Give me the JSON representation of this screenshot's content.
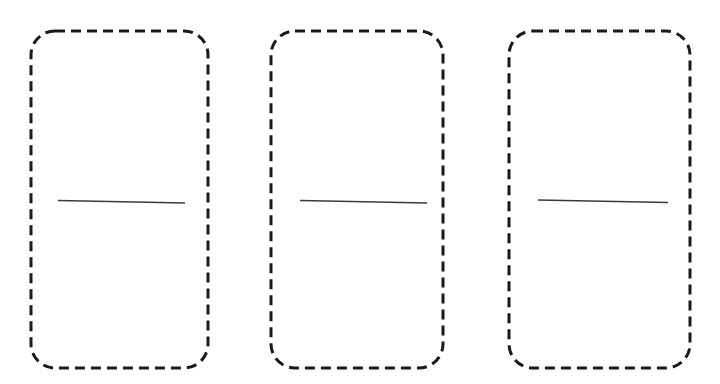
{
  "canvas": {
    "width": 720,
    "height": 384,
    "background_color": "#ffffff",
    "description": "Three blank domino tiles drawn as dashed rounded rectangles with a horizontal divider line"
  },
  "style": {
    "outline_color": "#1a1a1a",
    "outline_width": 3,
    "dash_length": 10,
    "dash_gap": 6,
    "corner_radius": 24,
    "divider_color": "#3a3a3a",
    "divider_width": 1.4,
    "fill_color": "#ffffff"
  },
  "tiles": [
    {
      "name": "tile-1",
      "label": "",
      "x": 31,
      "y": 31,
      "width": 177,
      "height": 337,
      "divider": {
        "x1": 58,
        "y1": 200.5,
        "x2": 185,
        "y2": 203.0
      },
      "top_pips": [],
      "bottom_pips": []
    },
    {
      "name": "tile-2",
      "label": "",
      "x": 271,
      "y": 31,
      "width": 172,
      "height": 337,
      "divider": {
        "x1": 300,
        "y1": 200.5,
        "x2": 427,
        "y2": 203.0
      },
      "top_pips": [],
      "bottom_pips": []
    },
    {
      "name": "tile-3",
      "label": "",
      "x": 509,
      "y": 31,
      "width": 181,
      "height": 337,
      "divider": {
        "x1": 538,
        "y1": 200.0,
        "x2": 668,
        "y2": 202.5
      },
      "top_pips": [],
      "bottom_pips": []
    }
  ]
}
